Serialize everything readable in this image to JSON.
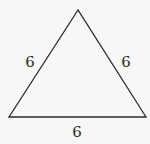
{
  "diagram": {
    "shape": "equilateral triangle",
    "vertices": [
      [
        78,
        10
      ],
      [
        9,
        117
      ],
      [
        146,
        117
      ]
    ],
    "stroke_color": "#2a2a2a",
    "background": "#f7f7f5",
    "side_labels": {
      "left": "6",
      "right": "6",
      "bottom": "6"
    }
  }
}
